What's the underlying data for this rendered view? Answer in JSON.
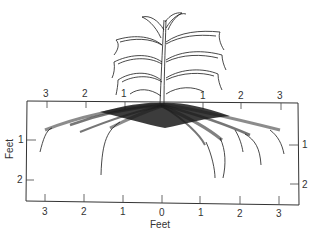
{
  "figure": {
    "colors": {
      "ink": "#1a1a1a",
      "frame": "#333333",
      "background": "#ffffff"
    }
  },
  "axes": {
    "top_ticks": [
      "3",
      "2",
      "1",
      "1",
      "2",
      "3"
    ],
    "bottom_ticks": [
      "3",
      "2",
      "1",
      "0",
      "1",
      "2",
      "3"
    ],
    "left_ticks": [
      "1",
      "2"
    ],
    "right_ticks": [
      "1",
      "2"
    ],
    "x_title": "Feet",
    "y_title": "Feet"
  }
}
